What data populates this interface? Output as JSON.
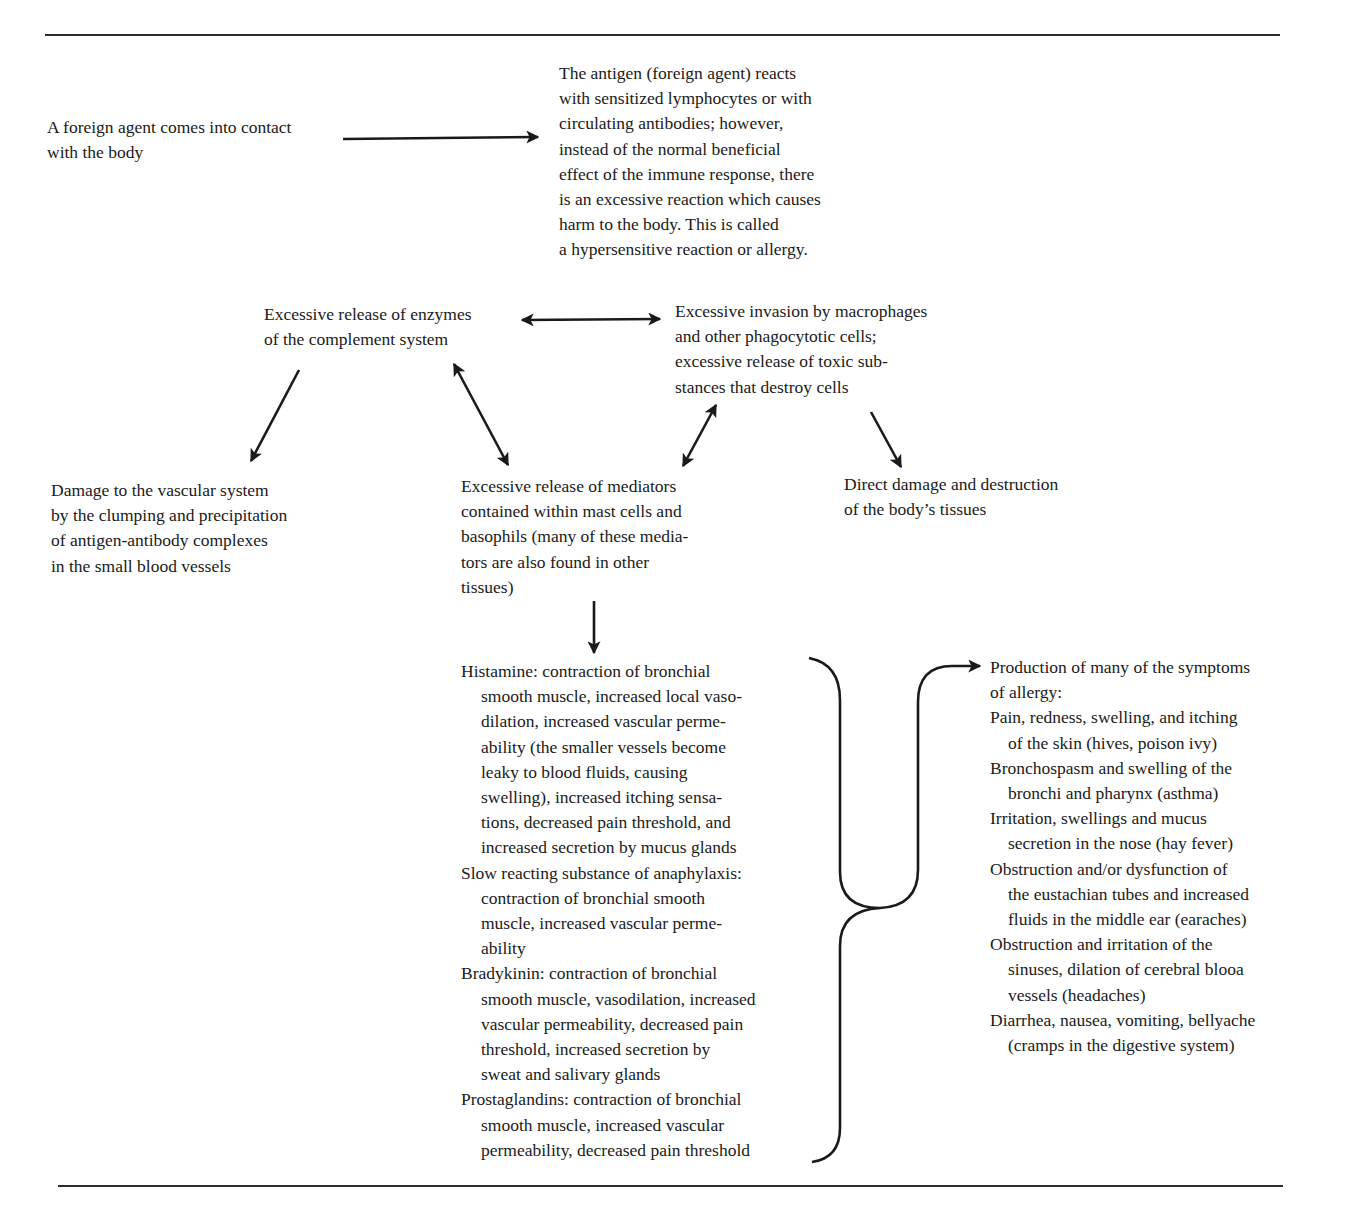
{
  "figure": {
    "start_node": {
      "lines": [
        "A foreign agent comes into contact",
        "with the body"
      ]
    },
    "antigen_reaction": {
      "lines": [
        "The antigen (foreign agent) reacts",
        "with sensitized lymphocytes or with",
        "circulating antibodies; however,",
        "instead of the normal beneficial",
        "effect of the immune response, there",
        "is an excessive reaction which causes",
        "harm to the body. This is called",
        "a hypersensitive reaction or allergy."
      ]
    },
    "complement_enzymes": {
      "lines": [
        "Excessive release of enzymes",
        "of the complement system"
      ]
    },
    "macrophage_invasion": {
      "lines": [
        "Excessive invasion by macrophages",
        "and other phagocytotic cells;",
        "excessive release of toxic sub-",
        "stances that destroy cells"
      ]
    },
    "vascular_damage": {
      "lines": [
        "Damage to the vascular system",
        "by the clumping and precipitation",
        "of antigen-antibody complexes",
        "in the small blood vessels"
      ]
    },
    "mediator_release": {
      "lines": [
        "Excessive release of mediators",
        "contained within mast cells and",
        "basophils (many of these media-",
        "tors are also found in other",
        "tissues)"
      ]
    },
    "tissue_damage": {
      "lines": [
        "Direct damage and destruction",
        "of the body’s tissues"
      ]
    },
    "mediators": [
      {
        "first": "Histamine: contraction of bronchial",
        "rest": [
          "smooth muscle, increased local vaso-",
          "dilation, increased vascular perme-",
          "ability (the smaller vessels become",
          "leaky to blood fluids, causing",
          "swelling), increased itching sensa-",
          "tions, decreased pain threshold, and",
          "increased secretion by mucus glands"
        ]
      },
      {
        "first": "Slow reacting substance of anaphylaxis:",
        "rest": [
          "contraction of bronchial smooth",
          "muscle, increased vascular perme-",
          "ability"
        ]
      },
      {
        "first": "Bradykinin: contraction of bronchial",
        "rest": [
          "smooth muscle, vasodilation, increased",
          "vascular permeability, decreased pain",
          "threshold, increased secretion by",
          "sweat and salivary glands"
        ]
      },
      {
        "first": "Prostaglandins: contraction of bronchial",
        "rest": [
          "smooth muscle, increased vascular",
          "permeability, decreased pain threshold"
        ]
      }
    ],
    "symptoms": {
      "heading": [
        "Production of many of the symptoms",
        "of allergy:"
      ],
      "items": [
        {
          "first": "Pain, redness, swelling, and itching",
          "rest": [
            "of the skin (hives, poison ivy)"
          ]
        },
        {
          "first": "Bronchospasm and swelling of the",
          "rest": [
            "bronchi and pharynx (asthma)"
          ]
        },
        {
          "first": "Irritation, swellings and mucus",
          "rest": [
            "secretion in the nose (hay fever)"
          ]
        },
        {
          "first": "Obstruction and/or dysfunction of",
          "rest": [
            "the eustachian tubes and increased",
            "fluids in the middle ear (earaches)"
          ]
        },
        {
          "first": "Obstruction and irritation of the",
          "rest": [
            "sinuses, dilation of cerebral blooa",
            "vessels (headaches)"
          ]
        },
        {
          "first": "Diarrhea, nausea, vomiting, bellyache",
          "rest": [
            "(cramps in the digestive system)"
          ]
        }
      ]
    },
    "colors": {
      "ink": "#1a1a1a",
      "background": "#ffffff"
    }
  }
}
